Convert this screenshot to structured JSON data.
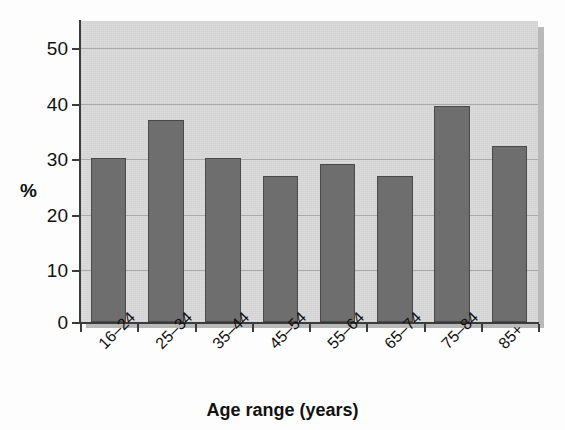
{
  "figure": {
    "background_color": "#fdfdfd",
    "plot_background_color": "#d9d9d9",
    "bar_color": "#6e6e6e",
    "bar_edge_color": "#4a4a4a",
    "axis_color": "#3b3b3b",
    "gridline_color": "#a9a9a9",
    "top_crop_fragment_left": "",
    "top_crop_fragment_right": ""
  },
  "chart_data": {
    "type": "bar",
    "title": "",
    "subtitle": "",
    "xlabel": "Age range (years)",
    "ylabel": "%",
    "categories": [
      "16–24",
      "25–34",
      "35–44",
      "45–54",
      "55–64",
      "65–74",
      "75–84",
      "85+"
    ],
    "values": [
      30.0,
      36.8,
      30.0,
      26.7,
      28.8,
      26.7,
      39.5,
      32.2
    ],
    "series": [
      {
        "name": "",
        "values": [
          30.0,
          36.8,
          30.0,
          26.7,
          28.8,
          26.7,
          39.5,
          32.2
        ]
      }
    ],
    "ylim": [
      0,
      54.5
    ],
    "yticks": [
      0,
      10,
      20,
      30,
      40,
      50
    ],
    "ytick_labels": [
      "0",
      "10",
      "20",
      "30",
      "40",
      "50"
    ],
    "xtick_label_rotation": -45,
    "grid": true,
    "grid_axis": "y",
    "legend": false,
    "legend_position": "none",
    "annotations": []
  }
}
